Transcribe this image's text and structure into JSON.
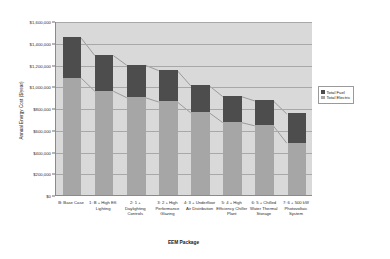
{
  "chart_data": {
    "type": "bar",
    "subtype": "stacked-bar-with-connectors",
    "title": "",
    "xlabel": "EEM Package",
    "ylabel": "Annual Energy Cost ($/year)",
    "ylim": [
      0,
      1600000
    ],
    "ytick_step": 200000,
    "ytick_labels": [
      "$1,600,000",
      "$1,400,000",
      "$1,200,000",
      "$1,000,000",
      "$800,000",
      "$600,000",
      "$400,000",
      "$200,000",
      "$0"
    ],
    "ytick_values": [
      1600000,
      1400000,
      1200000,
      1000000,
      800000,
      600000,
      400000,
      200000,
      0
    ],
    "grid": true,
    "legend_position": "right",
    "categories": [
      "B: Base Case",
      "1: B + High Eff. Lighting",
      "2: 1 + Daylighting Controls",
      "3: 2 + High Performance Glazing",
      "4: 3 + Underfloor Air Distribution",
      "5: 4 + High Efficiency Chiller Plant",
      "6: 5 + Chilled Water Thermal Storage",
      "7: 6 + 500 kW Photovoltaic System"
    ],
    "series": [
      {
        "name": "Total Electric",
        "color": "#a6a6a6",
        "values": [
          1080000,
          960000,
          900000,
          860000,
          760000,
          670000,
          640000,
          480000
        ]
      },
      {
        "name": "Total Fuel",
        "color": "#4d4d4d",
        "values": [
          370000,
          330000,
          300000,
          290000,
          250000,
          240000,
          230000,
          270000
        ]
      }
    ],
    "totals": [
      1450000,
      1290000,
      1200000,
      1150000,
      1010000,
      910000,
      870000,
      750000
    ]
  },
  "legend": {
    "items": [
      {
        "label": "Total Fuel",
        "color": "#4d4d4d"
      },
      {
        "label": "Total Electric",
        "color": "#a6a6a6"
      }
    ]
  }
}
